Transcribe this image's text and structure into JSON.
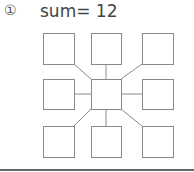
{
  "problem": {
    "number_label": "①",
    "title": "sum= 12"
  },
  "diagram": {
    "stroke_color": "#8a8a8a",
    "center_box": {
      "x": 91,
      "y": 79,
      "w": 30,
      "h": 30
    },
    "outer_boxes": [
      {
        "id": "top-left",
        "x": 43,
        "y": 33,
        "w": 31,
        "h": 31
      },
      {
        "id": "top",
        "x": 91,
        "y": 33,
        "w": 30,
        "h": 31
      },
      {
        "id": "top-right",
        "x": 142,
        "y": 33,
        "w": 31,
        "h": 31
      },
      {
        "id": "left",
        "x": 43,
        "y": 79,
        "w": 31,
        "h": 30
      },
      {
        "id": "right",
        "x": 142,
        "y": 79,
        "w": 31,
        "h": 30
      },
      {
        "id": "bottom-left",
        "x": 43,
        "y": 126,
        "w": 31,
        "h": 31
      },
      {
        "id": "bottom",
        "x": 91,
        "y": 126,
        "w": 30,
        "h": 31
      },
      {
        "id": "bottom-right",
        "x": 142,
        "y": 126,
        "w": 31,
        "h": 31
      }
    ]
  }
}
